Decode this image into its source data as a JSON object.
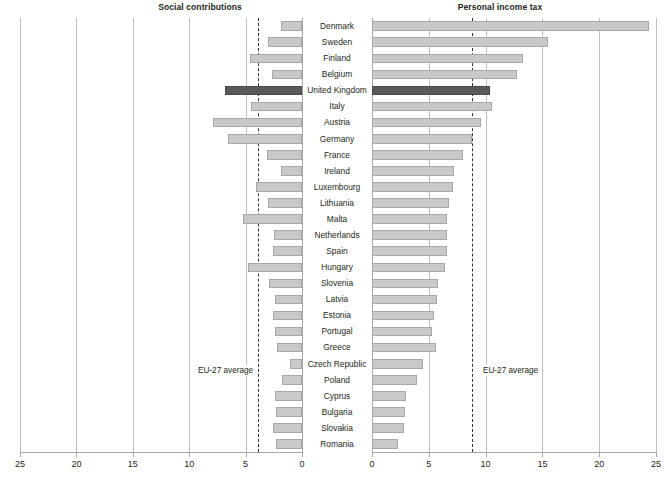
{
  "panels": {
    "left": {
      "title": "Social contributions",
      "axis_ticks": [
        25,
        20,
        15,
        10,
        5,
        0
      ],
      "axis_min": 0,
      "axis_max": 25,
      "direction": "right-to-left",
      "average_label": "EU-27 average",
      "average_value": 3.9
    },
    "right": {
      "title": "Personal income tax",
      "axis_ticks": [
        0,
        5,
        10,
        15,
        20,
        25
      ],
      "axis_min": 0,
      "axis_max": 25,
      "direction": "left-to-right",
      "average_label": "EU-27 average",
      "average_value": 8.8
    }
  },
  "highlight_country": "United Kingdom",
  "colors": {
    "bar": "#c9c9c9",
    "bar_highlight": "#595959",
    "gridline": "#bfbfbf",
    "axis": "#a6a6a6",
    "average_line": "#333333",
    "text": "#231f20"
  },
  "chart_data": {
    "type": "bar",
    "subtype": "paired horizontal bar (population pyramid style)",
    "categories": [
      "Denmark",
      "Sweden",
      "Finland",
      "Belgium",
      "United Kingdom",
      "Italy",
      "Austria",
      "Germany",
      "France",
      "Ireland",
      "Luxembourg",
      "Lithuania",
      "Malta",
      "Netherlands",
      "Spain",
      "Hungary",
      "Slovenia",
      "Latvia",
      "Estonia",
      "Portugal",
      "Greece",
      "Czech Republic",
      "Poland",
      "Cyprus",
      "Bulgaria",
      "Slovakia",
      "Romania"
    ],
    "series": [
      {
        "name": "Social contributions",
        "axis": "left",
        "xlabel": "Social contributions",
        "values": [
          1.9,
          3.0,
          4.6,
          2.7,
          6.8,
          4.5,
          7.9,
          6.6,
          3.1,
          1.9,
          4.1,
          3.0,
          5.2,
          2.5,
          2.6,
          4.8,
          2.9,
          2.4,
          2.6,
          2.4,
          2.2,
          1.1,
          1.8,
          2.4,
          2.3,
          2.6,
          2.3
        ]
      },
      {
        "name": "Personal income tax",
        "axis": "right",
        "xlabel": "Personal income tax",
        "values": [
          24.4,
          15.5,
          13.3,
          12.8,
          10.4,
          10.6,
          9.6,
          8.8,
          8.0,
          7.2,
          7.1,
          6.8,
          6.6,
          6.6,
          6.6,
          6.4,
          5.8,
          5.7,
          5.5,
          5.3,
          5.6,
          4.5,
          4.0,
          3.0,
          2.9,
          2.8,
          2.3
        ]
      }
    ],
    "xlabel": "% of GDP",
    "ylabel": "",
    "xlim": [
      0,
      25
    ],
    "grid": true,
    "legend": "none",
    "annotations": [
      {
        "text": "EU-27 average",
        "panel": "left",
        "value": 3.9
      },
      {
        "text": "EU-27 average",
        "panel": "right",
        "value": 8.8
      }
    ]
  }
}
